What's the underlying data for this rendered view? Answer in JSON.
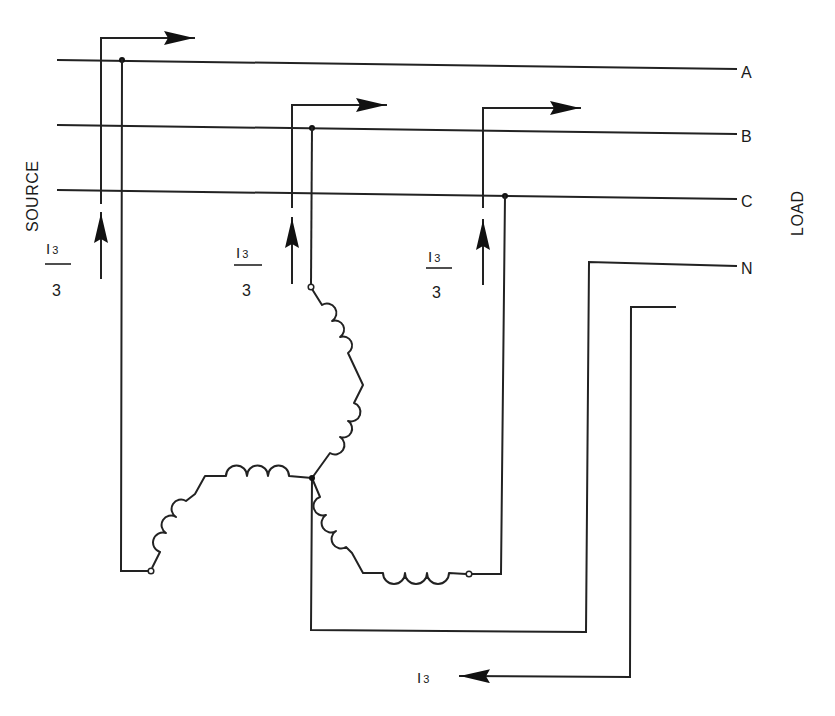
{
  "diagram": {
    "type": "wye-connected three-phase winding with zero-sequence current",
    "side_labels": {
      "source": "SOURCE",
      "load": "LOAD"
    },
    "lines": [
      {
        "id": "A",
        "label": "A"
      },
      {
        "id": "B",
        "label": "B"
      },
      {
        "id": "C",
        "label": "C"
      },
      {
        "id": "N",
        "label": "N"
      }
    ],
    "phase_currents": [
      {
        "phase": "A",
        "numerator": "I",
        "subscript": "3",
        "denominator": "3"
      },
      {
        "phase": "B",
        "numerator": "I",
        "subscript": "3",
        "denominator": "3"
      },
      {
        "phase": "C",
        "numerator": "I",
        "subscript": "3",
        "denominator": "3"
      }
    ],
    "neutral_current": {
      "symbol": "I",
      "subscript": "3"
    },
    "colors": {
      "ink": "#222222",
      "background": "#ffffff"
    }
  }
}
